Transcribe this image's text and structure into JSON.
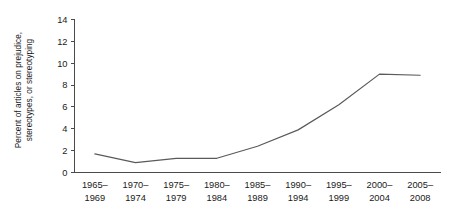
{
  "chart_data": {
    "type": "line",
    "title": "",
    "xlabel": "",
    "ylabel": "Percent of articles on prejudice, stereotypes, or stereotyping",
    "ylabel_line1": "Percent of articles on prejudice,",
    "ylabel_line2": "stereotypes, or stereotyping",
    "categories": [
      "1965–1969",
      "1970–1974",
      "1975–1979",
      "1980–1984",
      "1985–1989",
      "1990–1994",
      "1995–1999",
      "2000–2004",
      "2005–2008"
    ],
    "category_lines": [
      [
        "1965–",
        "1969"
      ],
      [
        "1970–",
        "1974"
      ],
      [
        "1975–",
        "1979"
      ],
      [
        "1980–",
        "1984"
      ],
      [
        "1985–",
        "1989"
      ],
      [
        "1990–",
        "1994"
      ],
      [
        "1995–",
        "1999"
      ],
      [
        "2000–",
        "2004"
      ],
      [
        "2005–",
        "2008"
      ]
    ],
    "values": [
      1.7,
      0.9,
      1.3,
      1.3,
      2.4,
      3.9,
      6.2,
      9.0,
      8.9
    ],
    "series": [
      {
        "name": "Percent of articles on prejudice, stereotypes, or stereotyping",
        "values": [
          1.7,
          0.9,
          1.3,
          1.3,
          2.4,
          3.9,
          6.2,
          9.0,
          8.9
        ],
        "color": "#5a5a5a"
      }
    ],
    "ylim": [
      0,
      14
    ],
    "yticks": [
      0,
      2,
      4,
      6,
      8,
      10,
      12,
      14
    ],
    "ytick_labels": [
      "0",
      "2",
      "4",
      "6",
      "8",
      "10",
      "12",
      "14"
    ],
    "grid": false,
    "legend": false,
    "legend_position": "none",
    "markers": false,
    "line_color": "#5a5a5a",
    "axis_color": "#4a4a4a",
    "background_color": "#ffffff"
  }
}
